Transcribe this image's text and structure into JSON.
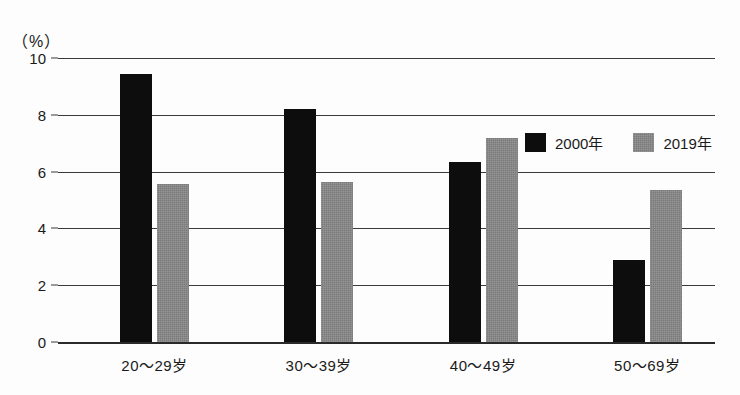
{
  "chart_data": {
    "type": "bar",
    "title": "",
    "subtitle": "",
    "xlabel": "",
    "ylabel": "",
    "unit_label": "（%）",
    "categories": [
      "20～29岁",
      "30～39岁",
      "40～49岁",
      "50～69岁"
    ],
    "series": [
      {
        "name": "2000年",
        "color": "#0d0d0d",
        "values": [
          9.45,
          8.2,
          6.35,
          2.9
        ]
      },
      {
        "name": "2019年",
        "color": "#7b7b7b",
        "values": [
          5.55,
          5.65,
          7.2,
          5.35
        ]
      }
    ],
    "ylim": [
      0,
      10
    ],
    "ytick_values": [
      10,
      8,
      6,
      4,
      2,
      0
    ],
    "ytick_labels": [
      "10",
      "8",
      "6",
      "4",
      "2",
      "0"
    ],
    "ytick_step": 2,
    "grid": true,
    "grid_axis": "y",
    "legend_position": "top-right-inside",
    "bar_group_count": 4,
    "bars_per_group": 2
  },
  "legend": {
    "items": [
      {
        "label": "2000年",
        "swatch": "black-square-swatch"
      },
      {
        "label": "2019年",
        "swatch": "gray-square-swatch"
      }
    ]
  }
}
